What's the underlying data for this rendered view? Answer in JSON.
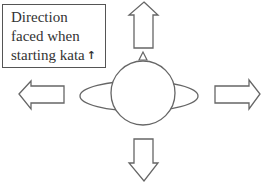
{
  "diagram": {
    "caption": {
      "lines": [
        "Direction",
        "faced when",
        "starting kata"
      ],
      "arrow_glyph": "↑",
      "arrow_icon": "up-arrow-icon"
    },
    "figure": {
      "description": "Top-down view of a person (head circle with arms ellipse and nose marker) with arrows pointing in four directions",
      "arrows": [
        "up",
        "down",
        "left",
        "right"
      ],
      "stroke_color": "#666666",
      "fill_color": "#ffffff"
    }
  }
}
